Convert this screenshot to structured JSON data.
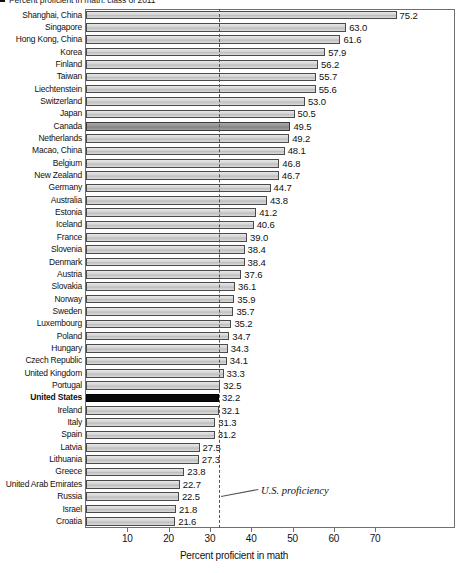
{
  "title": {
    "bullet_marker": "■",
    "lead": "Percent proficient in math: class of 2011",
    "bold_tail": "class of 2011"
  },
  "chart_data": {
    "type": "bar",
    "orientation": "horizontal",
    "title": "Percent proficient in math: class of 2011",
    "xlabel": "Percent proficient in math",
    "ylabel": "",
    "xlim": [
      0,
      80
    ],
    "xticks": [
      10,
      20,
      30,
      40,
      50,
      60,
      70
    ],
    "grid": false,
    "legend": null,
    "annotations": [
      {
        "text": "U.S. proficiency",
        "value": 32.2,
        "style": "dashed-vertical-line"
      }
    ],
    "highlight": {
      "united_states": "#0a0a0a",
      "canada": "#949494",
      "default": "#d2d2d2"
    },
    "categories": [
      "Shanghai, China",
      "Singapore",
      "Hong Kong, China",
      "Korea",
      "Finland",
      "Taiwan",
      "Liechtenstein",
      "Switzerland",
      "Japan",
      "Canada",
      "Netherlands",
      "Macao, China",
      "Belgium",
      "New Zealand",
      "Germany",
      "Australia",
      "Estonia",
      "Iceland",
      "France",
      "Slovenia",
      "Denmark",
      "Austria",
      "Slovakia",
      "Norway",
      "Sweden",
      "Luxembourg",
      "Poland",
      "Hungary",
      "Czech Republic",
      "United Kingdom",
      "Portugal",
      "United States",
      "Ireland",
      "Italy",
      "Spain",
      "Latvia",
      "Lithuania",
      "Greece",
      "United Arab Emirates",
      "Russia",
      "Israel",
      "Croatia"
    ],
    "values": [
      75.2,
      63.0,
      61.6,
      57.9,
      56.2,
      55.7,
      55.6,
      53.0,
      50.5,
      49.5,
      49.2,
      48.1,
      46.8,
      46.7,
      44.7,
      43.8,
      41.2,
      40.6,
      39.0,
      38.4,
      38.4,
      37.6,
      36.1,
      35.9,
      35.7,
      35.2,
      34.7,
      34.3,
      34.1,
      33.3,
      32.5,
      32.2,
      32.1,
      31.3,
      31.2,
      27.5,
      27.3,
      23.8,
      22.7,
      22.5,
      21.8,
      21.6
    ],
    "value_labels": [
      "75.2",
      "63.0",
      "61.6",
      "57.9",
      "56.2",
      "55.7",
      "55.6",
      "53.0",
      "50.5",
      "49.5",
      "49.2",
      "48.1",
      "46.8",
      "46.7",
      "44.7",
      "43.8",
      "41.2",
      "40.6",
      "39.0",
      "38.4",
      "38.4",
      "37.6",
      "36.1",
      "35.9",
      "35.7",
      "35.2",
      "34.7",
      "34.3",
      "34.1",
      "33.3",
      "32.5",
      "32.2",
      "32.1",
      "31.3",
      "31.2",
      "27.5",
      "27.3",
      "23.8",
      "22.7",
      "22.5",
      "21.8",
      "21.6"
    ],
    "bold_categories": [
      "United States"
    ],
    "dark_bar_categories": [
      "Canada"
    ],
    "black_bar_categories": [
      "United States"
    ]
  }
}
